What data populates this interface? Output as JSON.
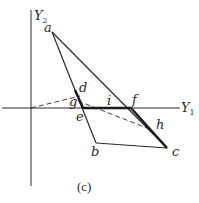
{
  "figure": {
    "caption": "(c)",
    "axes": {
      "y1_label": "Y",
      "y1_sub": "1",
      "y2_label": "Y",
      "y2_sub": "2"
    },
    "points": [
      {
        "name": "a",
        "label": "a",
        "x": 52,
        "y": 32
      },
      {
        "name": "b",
        "label": "b",
        "x": 96,
        "y": 143
      },
      {
        "name": "c",
        "label": "c",
        "x": 167,
        "y": 148
      },
      {
        "name": "d",
        "label": "d",
        "x": 80,
        "y": 96
      },
      {
        "name": "e",
        "label": "e",
        "x": 83,
        "y": 108
      },
      {
        "name": "f",
        "label": "f",
        "x": 131,
        "y": 108
      },
      {
        "name": "g",
        "label": "g",
        "x": 78,
        "y": 101
      },
      {
        "name": "h",
        "label": "h",
        "x": 152,
        "y": 130
      },
      {
        "name": "i",
        "label": "i",
        "x": 110,
        "y": 108
      }
    ],
    "colors": {
      "line": "#2a2a2a",
      "background": "#ffffff"
    }
  }
}
